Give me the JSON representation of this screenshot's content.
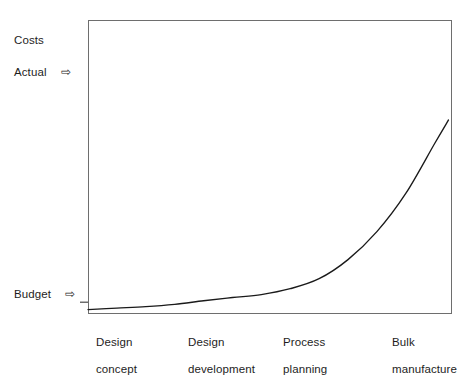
{
  "chart_data": {
    "type": "line",
    "title": "",
    "subtitle": "",
    "xlabel": "",
    "ylabel": "Costs",
    "grid": false,
    "legend_position": "none",
    "categories": [
      "Design\nconcept",
      "Design\ndevelopment",
      "Process\nplanning",
      "Bulk\nmanufacture"
    ],
    "x": [
      0,
      1,
      2,
      3
    ],
    "xlim": [
      0,
      3.15
    ],
    "ylim": [
      0,
      100
    ],
    "series": [
      {
        "name": "Actual costs",
        "values": [
          1.5,
          4.5,
          12,
          58
        ],
        "points": [
          {
            "x": 0,
            "y": 1.5
          },
          {
            "x": 0.25,
            "y": 2.0
          },
          {
            "x": 0.5,
            "y": 2.5
          },
          {
            "x": 0.75,
            "y": 3.3
          },
          {
            "x": 1.0,
            "y": 4.5
          },
          {
            "x": 1.25,
            "y": 5.6
          },
          {
            "x": 1.5,
            "y": 6.6
          },
          {
            "x": 1.75,
            "y": 8.6
          },
          {
            "x": 2.0,
            "y": 12.0
          },
          {
            "x": 2.25,
            "y": 18.5
          },
          {
            "x": 2.5,
            "y": 28.0
          },
          {
            "x": 2.75,
            "y": 41.0
          },
          {
            "x": 3.0,
            "y": 58.0
          },
          {
            "x": 3.12,
            "y": 66.0
          }
        ],
        "color": "#1a1a1a",
        "shape": "exponential-growth"
      }
    ],
    "annotations": [
      {
        "name": "actual",
        "label": "Actual",
        "arrow": "⇨",
        "y_value": 76
      },
      {
        "name": "budget",
        "label": "Budget",
        "arrow": "⇨",
        "y_value": 4,
        "tick": true
      }
    ]
  },
  "axis": {
    "y_title": "Costs"
  },
  "annotations": {
    "actual": {
      "label": "Actual",
      "arrow": "⇨"
    },
    "budget": {
      "label": "Budget",
      "arrow": "⇨"
    }
  },
  "x_categories": [
    {
      "line1": "Design",
      "line2": "concept"
    },
    {
      "line1": "Design",
      "line2": "development"
    },
    {
      "line1": "Process",
      "line2": "planning"
    },
    {
      "line1": "Bulk",
      "line2": "manufacture"
    }
  ],
  "colors": {
    "curve": "#1a1a1a",
    "frame": "#6e6e6e",
    "text": "#1d1d1d",
    "background": "#ffffff"
  }
}
